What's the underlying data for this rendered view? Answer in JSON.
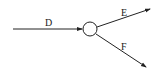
{
  "diagram": {
    "type": "flow-split",
    "node": {
      "shape": "circle",
      "label": ""
    },
    "edges": [
      {
        "label": "D",
        "direction": "incoming"
      },
      {
        "label": "E",
        "direction": "outgoing-up-right"
      },
      {
        "label": "F",
        "direction": "outgoing-down-right"
      }
    ],
    "colors": {
      "stroke": "#222222",
      "background": "#ffffff"
    }
  }
}
